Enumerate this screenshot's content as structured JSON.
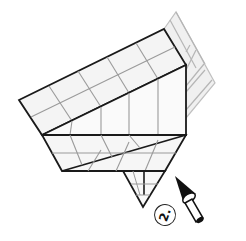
{
  "diagram": {
    "type": "origami-fold-instruction",
    "step_number": "2.",
    "colors": {
      "outline": "#1a1a1a",
      "crease": "#9a9a9a",
      "shaded_grid": "#b5b5b5",
      "paper": "#f4f4f4",
      "arrow_fill": "#111111"
    },
    "elements": {
      "rotated_band": "upper grid band (folded flap)",
      "behind_layer": "shaded grid extending behind at upper right",
      "lower_band": "lower grid band",
      "bottom_flap": "small triangular point at bottom",
      "push_arrow": "push / fold-in arrow pointing up-left"
    }
  }
}
